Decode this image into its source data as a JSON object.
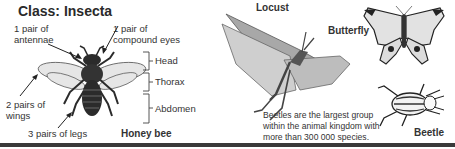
{
  "title": "Class: Insecta",
  "honey_bee": {
    "name": "Honey bee",
    "annotations": {
      "antennae": [
        "1 pair of",
        "antennae"
      ],
      "eyes": [
        "1 pair of",
        "compound eyes"
      ],
      "wings": [
        "2 pairs of",
        "wings"
      ],
      "legs": "3 pairs of legs"
    },
    "body_parts": [
      "Head",
      "Thorax",
      "Abdomen"
    ]
  },
  "locust": {
    "name": "Locust"
  },
  "butterfly": {
    "name": "Butterfly"
  },
  "beetle": {
    "name": "Beetle",
    "note": [
      "Beetles are the largest group",
      "within the animal kingdom with",
      "more than 300 000 species."
    ]
  },
  "colors": {
    "text": "#333333",
    "insect_dark": "#2b2b2b",
    "insect_mid": "#8a8a8a",
    "wing": "#d8d8d8",
    "rule": "#3a3a3a"
  }
}
